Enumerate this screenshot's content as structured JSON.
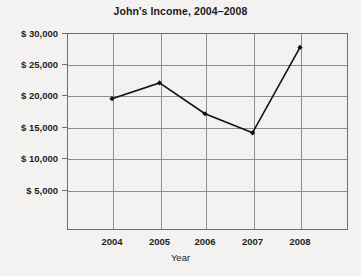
{
  "chart_data": {
    "type": "line",
    "title": "John's Income, 2004–2008",
    "xlabel": "Year",
    "ylabel": "",
    "categories": [
      "2004",
      "2005",
      "2006",
      "2007",
      "2008"
    ],
    "x": [
      2004,
      2005,
      2006,
      2007,
      2008
    ],
    "values": [
      20000,
      22400,
      17700,
      14800,
      27800
    ],
    "series": [
      {
        "name": "Income",
        "values": [
          20000,
          22400,
          17700,
          14800,
          27800
        ]
      }
    ],
    "ylim": [
      0,
      30000
    ],
    "xlim": [
      2003.5,
      2008.5
    ],
    "ytick_values": [
      5000,
      10000,
      15000,
      20000,
      25000,
      30000
    ],
    "ytick_labels": [
      "$ 5,000",
      "$ 10,000",
      "$ 15,000",
      "$ 20,000",
      "$ 25,000",
      "$ 30,000"
    ],
    "xtick_labels": [
      "2004",
      "2005",
      "2006",
      "2007",
      "2008"
    ],
    "grid": true,
    "legend": "none",
    "marker": "diamond",
    "line_color": "#111111",
    "grid_color": "#8d8d8d",
    "frame_color": "#6e6e6e",
    "background_color": "#f3f2f0"
  }
}
